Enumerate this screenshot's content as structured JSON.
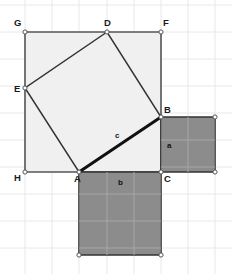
{
  "canvas": {
    "width": 232,
    "height": 274,
    "background": "#ffffff"
  },
  "grid": {
    "visible": true,
    "spacing": 27,
    "color": "#e8e8e8",
    "origin_x": 25,
    "origin_y": 32,
    "x_lines": [
      -2,
      25,
      52,
      79,
      107,
      134,
      161,
      188,
      215
    ],
    "y_lines": [
      5,
      32,
      59,
      86,
      113,
      140,
      167,
      194,
      221,
      248
    ]
  },
  "style": {
    "square_light_fill": "#f0f0f0",
    "square_dark_fill": "#8c8c8c",
    "outline_color": "#555555",
    "accent_color": "#111111",
    "vertex_dot_fill": "#ffffff",
    "vertex_dot_stroke": "#555555",
    "hypotenuse_color": "#111111"
  },
  "vertices": [
    {
      "id": "G",
      "label": "G",
      "x": 25,
      "y": 32,
      "label_x": 14,
      "label_y": 26
    },
    {
      "id": "D",
      "label": "D",
      "x": 107,
      "y": 32,
      "label_x": 104,
      "label_y": 26
    },
    {
      "id": "F",
      "label": "F",
      "x": 161,
      "y": 32,
      "label_x": 163,
      "label_y": 26
    },
    {
      "id": "E",
      "label": "E",
      "x": 25,
      "y": 88,
      "label_x": 14,
      "label_y": 92
    },
    {
      "id": "B",
      "label": "B",
      "x": 161,
      "y": 117,
      "label_x": 164,
      "label_y": 113
    },
    {
      "id": "H",
      "label": "H",
      "x": 25,
      "y": 172,
      "label_x": 14,
      "label_y": 181
    },
    {
      "id": "A",
      "label": "A",
      "x": 79,
      "y": 172,
      "label_x": 74,
      "label_y": 182
    },
    {
      "id": "C",
      "label": "C",
      "x": 161,
      "y": 172,
      "label_x": 164,
      "label_y": 182
    }
  ],
  "extra_points": [
    {
      "id": "square-a-top-right",
      "x": 215,
      "y": 117
    },
    {
      "id": "square-a-bottom-right",
      "x": 215,
      "y": 172
    },
    {
      "id": "square-b-bottom-left",
      "x": 79,
      "y": 255
    },
    {
      "id": "square-b-bottom-right",
      "x": 161,
      "y": 255
    }
  ],
  "shapes": {
    "outer_square": {
      "name": "square-GFCH",
      "points": "25,32 161,32 161,172 25,172",
      "fill": "#f0f0f0",
      "stroke": "#555555"
    },
    "square_a": {
      "name": "square-a",
      "points": "161,117 215,117 215,172 161,172",
      "fill": "#8c8c8c",
      "stroke": "#333333",
      "label": "a",
      "label_x": 167,
      "label_y": 148
    },
    "square_b": {
      "name": "square-b",
      "points": "79,172 161,172 161,255 79,255",
      "fill": "#8c8c8c",
      "stroke": "#333333",
      "label": "b",
      "label_x": 118,
      "label_y": 185
    },
    "tilted_square": {
      "name": "tilted-square-DEAB",
      "points": "107,32 25,88 79,172 161,117",
      "fill": "none",
      "stroke": "#333333"
    },
    "hypotenuse": {
      "name": "hypotenuse-AB",
      "x1": 79,
      "y1": 172,
      "x2": 161,
      "y2": 117,
      "label": "c",
      "label_x": 115,
      "label_y": 138,
      "stroke": "#111111",
      "width": 3
    }
  },
  "labels": {
    "side_a": "a",
    "side_b": "b",
    "side_c": "c"
  }
}
